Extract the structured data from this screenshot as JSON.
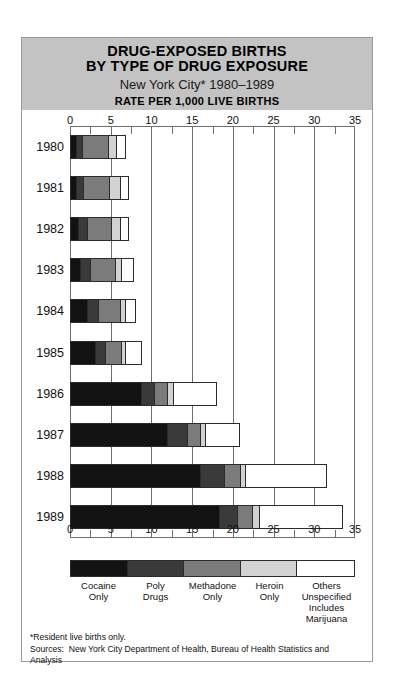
{
  "header": {
    "title_line1": "DRUG-EXPOSED BIRTHS",
    "title_line2": "BY TYPE OF DRUG EXPOSURE",
    "subtitle": "New York City* 1980–1989",
    "rate_line": "RATE PER 1,000 LIVE BIRTHS",
    "band_color": "#c3c3c3"
  },
  "notes": {
    "footnote": "*Resident live births only.",
    "sources": "Sources:  New York City Department of Health, Bureau of Health Statistics and",
    "sources_cont": "Analysis"
  },
  "legend": {
    "items": [
      {
        "label_line1": "Cocaine",
        "label_line2": "Only",
        "label_line3": "",
        "color": "#121212"
      },
      {
        "label_line1": "Poly",
        "label_line2": "Drugs",
        "label_line3": "",
        "color": "#3a3a3a"
      },
      {
        "label_line1": "Methadone",
        "label_line2": "Only",
        "label_line3": "",
        "color": "#7b7b7b"
      },
      {
        "label_line1": "Heroin",
        "label_line2": "Only",
        "label_line3": "",
        "color": "#d2d2d2"
      },
      {
        "label_line1": "Others",
        "label_line2": "Unspecified",
        "label_line3": "Includes Marijuana",
        "color": "#ffffff"
      }
    ]
  },
  "chart_data": {
    "type": "bar",
    "orientation": "horizontal",
    "stacked": true,
    "title": "DRUG-EXPOSED BIRTHS BY TYPE OF DRUG EXPOSURE",
    "subtitle": "New York City* 1980–1989",
    "xlabel": "RATE PER 1,000 LIVE BIRTHS",
    "ylabel": "",
    "xlim": [
      0,
      35
    ],
    "xticks": [
      0,
      5,
      10,
      15,
      20,
      25,
      30,
      35
    ],
    "xtick_labels": [
      "0",
      "5",
      "10",
      "15",
      "20",
      "25",
      "30",
      "35"
    ],
    "minor_tick_step": 2.5,
    "grid": true,
    "legend_position": "bottom",
    "categories": [
      "1980",
      "1981",
      "1982",
      "1983",
      "1984",
      "1985",
      "1986",
      "1987",
      "1988",
      "1989"
    ],
    "series": [
      {
        "name": "Cocaine Only",
        "color": "#121212",
        "values": [
          0.7,
          0.8,
          1.0,
          1.3,
          2.1,
          3.1,
          8.8,
          12.1,
          16.1,
          18.4
        ]
      },
      {
        "name": "Poly Drugs",
        "color": "#3a3a3a",
        "values": [
          0.8,
          0.9,
          1.1,
          1.2,
          1.5,
          1.3,
          1.7,
          2.5,
          2.9,
          2.2
        ]
      },
      {
        "name": "Methadone Only",
        "color": "#7b7b7b",
        "values": [
          3.4,
          3.3,
          3.1,
          3.2,
          2.7,
          2.0,
          1.6,
          1.5,
          2.1,
          1.9
        ]
      },
      {
        "name": "Heroin Only",
        "color": "#d2d2d2",
        "values": [
          1.0,
          1.4,
          1.2,
          0.8,
          0.7,
          0.5,
          0.7,
          0.7,
          0.6,
          0.9
        ]
      },
      {
        "name": "Others Unspecified",
        "color": "#ffffff",
        "values": [
          1.0,
          0.9,
          0.9,
          1.4,
          1.1,
          2.0,
          5.3,
          4.1,
          9.9,
          10.1
        ]
      }
    ],
    "totals": [
      6.9,
      7.3,
      7.3,
      7.9,
      8.1,
      8.9,
      18.1,
      20.9,
      31.6,
      33.5
    ]
  }
}
